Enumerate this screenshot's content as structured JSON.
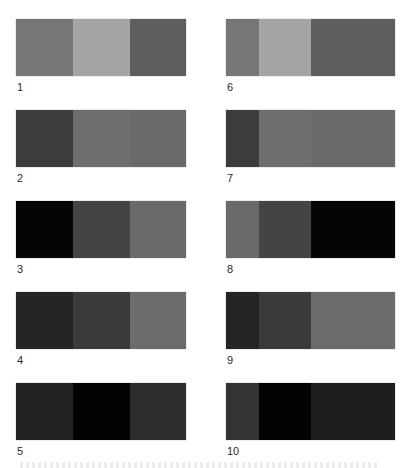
{
  "figure": {
    "panels": [
      {
        "label": "1",
        "segments": [
          {
            "width": 57,
            "color": "#777777"
          },
          {
            "width": 57,
            "color": "#a5a5a5"
          },
          {
            "width": 56,
            "color": "#5e5e5e"
          }
        ]
      },
      {
        "label": "2",
        "segments": [
          {
            "width": 57,
            "color": "#3c3c3c"
          },
          {
            "width": 57,
            "color": "#6e6e6e"
          },
          {
            "width": 56,
            "color": "#6a6a6a"
          }
        ]
      },
      {
        "label": "3",
        "segments": [
          {
            "width": 57,
            "color": "#050505"
          },
          {
            "width": 57,
            "color": "#444444"
          },
          {
            "width": 56,
            "color": "#6a6a6a"
          }
        ]
      },
      {
        "label": "4",
        "segments": [
          {
            "width": 57,
            "color": "#242424"
          },
          {
            "width": 57,
            "color": "#3a3a3a"
          },
          {
            "width": 56,
            "color": "#6c6c6c"
          }
        ]
      },
      {
        "label": "5",
        "segments": [
          {
            "width": 57,
            "color": "#222222"
          },
          {
            "width": 57,
            "color": "#020202"
          },
          {
            "width": 56,
            "color": "#2c2c2c"
          }
        ]
      },
      {
        "label": "6",
        "segments": [
          {
            "width": 33,
            "color": "#777777"
          },
          {
            "width": 52,
            "color": "#a5a5a5"
          },
          {
            "width": 84,
            "color": "#5e5e5e"
          }
        ]
      },
      {
        "label": "7",
        "segments": [
          {
            "width": 33,
            "color": "#3c3c3c"
          },
          {
            "width": 52,
            "color": "#6e6e6e"
          },
          {
            "width": 84,
            "color": "#6a6a6a"
          }
        ]
      },
      {
        "label": "8",
        "segments": [
          {
            "width": 33,
            "color": "#6a6a6a"
          },
          {
            "width": 52,
            "color": "#444444"
          },
          {
            "width": 84,
            "color": "#050505"
          }
        ]
      },
      {
        "label": "9",
        "segments": [
          {
            "width": 33,
            "color": "#242424"
          },
          {
            "width": 52,
            "color": "#3a3a3a"
          },
          {
            "width": 84,
            "color": "#6c6c6c"
          }
        ]
      },
      {
        "label": "10",
        "segments": [
          {
            "width": 33,
            "color": "#333333"
          },
          {
            "width": 52,
            "color": "#020202"
          },
          {
            "width": 84,
            "color": "#1e1e1e"
          }
        ]
      }
    ]
  }
}
